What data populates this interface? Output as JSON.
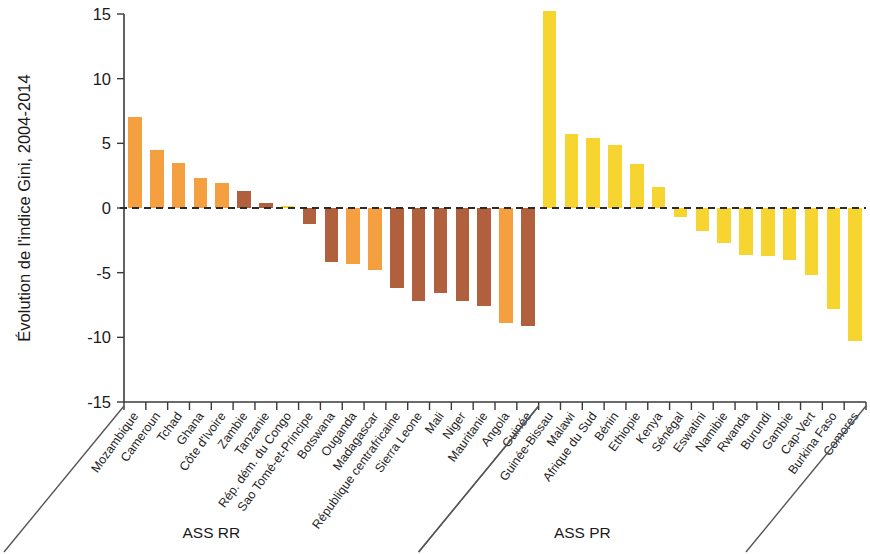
{
  "chart_data": {
    "type": "bar",
    "title": "",
    "subtitle": "",
    "xlabel": "",
    "ylabel": "Évolution de l'indice Gini, 2004-2014",
    "ylim": [
      -15,
      15
    ],
    "yticks": [
      15,
      10,
      5,
      0,
      -5,
      -10,
      -15
    ],
    "ytick_labels": [
      "15",
      "10",
      "5",
      "0",
      "-5",
      "-10",
      "-15"
    ],
    "grid": false,
    "legend_position": "none",
    "zero_reference_line": true,
    "colors": {
      "orange": "#F5A040",
      "brown": "#B0603C",
      "yellow": "#F7D530",
      "axis": "#3A3A3A",
      "text": "#1A1A1A"
    },
    "groups": [
      {
        "name": "ASS RR",
        "label": "ASS RR",
        "start_index": 0,
        "end_index": 23
      },
      {
        "name": "ASS PR",
        "label": "ASS PR",
        "start_index": 24,
        "end_index": 41
      }
    ],
    "categories": [
      "Mozambique",
      "Cameroun",
      "Tchad",
      "Ghana",
      "Côte d'Ivoire",
      "Zambie",
      "Tanzanie",
      "Rép. dém. du Congo",
      "Sao Tomé-et-Principe",
      "Botswana",
      "Ouganda",
      "Madagascar",
      "République centrafricaine",
      "Sierra Leone",
      "Mali",
      "Niger",
      "Mauritanie",
      "Angola",
      "Guinée",
      "Guinée-Bissau",
      "Malawi",
      "Afrique du Sud",
      "Bénin",
      "Ethiopie",
      "Kenya",
      "Sénégal",
      "Eswatini",
      "Namibie",
      "Rwanda",
      "Burundi",
      "Gambie",
      "Cap-Vert",
      "Burkina Faso",
      "Comores"
    ],
    "values": [
      7.0,
      4.5,
      3.5,
      2.3,
      1.9,
      1.3,
      0.4,
      0.15,
      -1.2,
      -4.2,
      -4.3,
      -4.8,
      -6.2,
      -7.2,
      -6.6,
      -7.2,
      -7.6,
      -8.9,
      -9.1,
      15.2,
      5.7,
      5.4,
      4.9,
      3.4,
      1.6,
      -0.7,
      -1.8,
      -2.7,
      -3.6,
      -3.7,
      -4.0,
      -5.2,
      -7.8,
      -10.3
    ],
    "bar_colors": [
      "orange",
      "orange",
      "orange",
      "orange",
      "orange",
      "brown",
      "brown",
      "yellow",
      "brown",
      "brown",
      "orange",
      "orange",
      "brown",
      "brown",
      "brown",
      "brown",
      "brown",
      "orange",
      "brown",
      "yellow",
      "yellow",
      "yellow",
      "yellow",
      "yellow",
      "yellow",
      "yellow",
      "yellow",
      "yellow",
      "yellow",
      "yellow",
      "yellow",
      "yellow",
      "yellow",
      "yellow"
    ]
  }
}
